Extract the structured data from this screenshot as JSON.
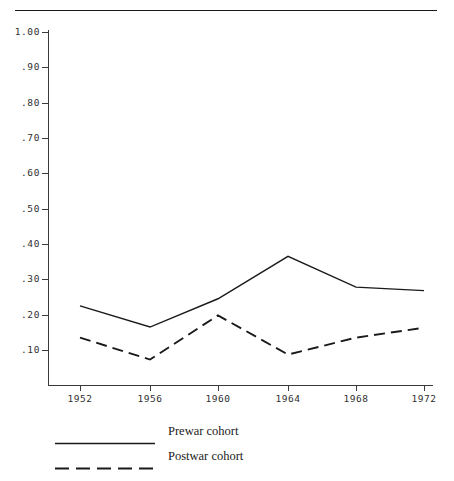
{
  "figure": {
    "name": "cohort-turnout-line-chart",
    "background": "#ffffff",
    "ink_color": "#1a1a1a",
    "top_rule": true
  },
  "chart_data": {
    "type": "line",
    "title": "",
    "subtitle": "",
    "xlabel": "",
    "ylabel": "",
    "categories": [
      "1952",
      "1956",
      "1960",
      "1964",
      "1968",
      "1972"
    ],
    "x": [
      1952,
      1956,
      1960,
      1964,
      1968,
      1972
    ],
    "xlim": [
      1950,
      1974
    ],
    "ylim": [
      0.0,
      1.0
    ],
    "grid": false,
    "legend_position": "below-axes-left",
    "y_ticks": [
      1.0,
      0.9,
      0.8,
      0.7,
      0.6,
      0.5,
      0.4,
      0.3,
      0.2,
      0.1
    ],
    "y_tick_labels": [
      "1.00",
      ".90",
      ".80",
      ".70",
      ".60",
      ".50",
      ".40",
      ".30",
      ".20",
      ".10"
    ],
    "x_ticks": [
      1952,
      1956,
      1960,
      1964,
      1968,
      1972
    ],
    "x_tick_labels": [
      "1952",
      "1956",
      "1960",
      "1964",
      "1968",
      "1972"
    ],
    "series": [
      {
        "name": "Prewar cohort",
        "style": "solid",
        "color": "#1a1a1a",
        "values": [
          0.225,
          0.165,
          0.245,
          0.365,
          0.278,
          0.268
        ]
      },
      {
        "name": "Postwar cohort",
        "style": "dashed",
        "color": "#1a1a1a",
        "values": [
          0.135,
          0.073,
          0.198,
          0.087,
          0.135,
          0.163
        ]
      }
    ]
  },
  "legend": {
    "items": [
      {
        "label": "Prewar cohort",
        "style": "solid"
      },
      {
        "label": "Postwar cohort",
        "style": "dashed"
      }
    ]
  }
}
